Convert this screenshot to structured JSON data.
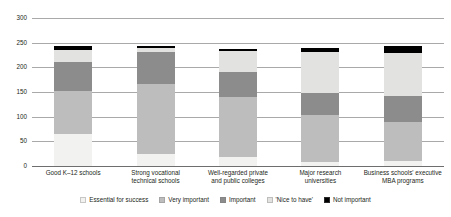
{
  "chart_data": {
    "type": "bar",
    "subtype": "stacked-bar",
    "title": "",
    "xlabel": "",
    "ylabel": "",
    "ylim": [
      0,
      300
    ],
    "yticks": [
      0,
      50,
      100,
      150,
      200,
      250,
      300
    ],
    "grid": true,
    "legend_position": "bottom",
    "categories": [
      "Good K–12 schools",
      "Strong vocational technical schools",
      "Well-regarded private and public colleges",
      "Major research universities",
      "Business schools' executive MBA programs"
    ],
    "series": [
      {
        "name": "Essential for success",
        "color": "#f2f2f0",
        "values": [
          65,
          25,
          18,
          8,
          10
        ]
      },
      {
        "name": "Very important",
        "color": "#bdbdbd",
        "values": [
          87,
          142,
          122,
          95,
          80
        ]
      },
      {
        "name": "Important",
        "color": "#8c8c8c",
        "values": [
          58,
          65,
          50,
          45,
          52
        ]
      },
      {
        "name": "'Nice to have'",
        "color": "#e2e2e0",
        "values": [
          26,
          8,
          43,
          83,
          87
        ]
      },
      {
        "name": "Not important",
        "color": "#000000",
        "values": [
          7,
          4,
          5,
          9,
          14
        ]
      }
    ],
    "totals": [
      243,
      244,
      238,
      240,
      243
    ]
  },
  "axis": {
    "y_tick_labels": [
      "300",
      "250",
      "200",
      "150",
      "100",
      "50",
      "0"
    ]
  },
  "legend": {
    "items": [
      {
        "label": "Essential for success",
        "color": "#f2f2f0"
      },
      {
        "label": "Very important",
        "color": "#bdbdbd"
      },
      {
        "label": "Important",
        "color": "#8c8c8c"
      },
      {
        "label": "'Nice to have'",
        "color": "#e2e2e0"
      },
      {
        "label": "Not important",
        "color": "#000000"
      }
    ]
  },
  "xlabels": [
    {
      "lines": [
        "Good K–12 schools"
      ]
    },
    {
      "lines": [
        "Strong vocational",
        "technical schools"
      ]
    },
    {
      "lines": [
        "Well-regarded private",
        "and public colleges"
      ]
    },
    {
      "lines": [
        "Major research",
        "universities"
      ]
    },
    {
      "lines": [
        "Business schools' executive",
        "MBA programs"
      ]
    }
  ]
}
